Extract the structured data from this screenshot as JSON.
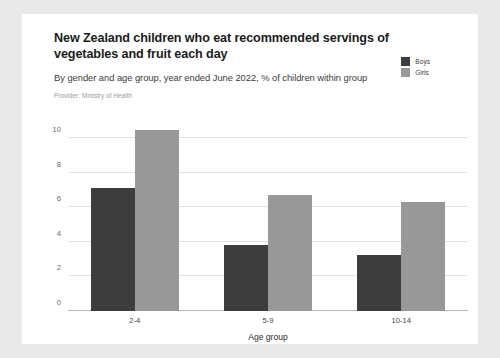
{
  "card": {
    "background": "#ffffff",
    "page_background": "#e9e9e9"
  },
  "header": {
    "title": "New Zealand children who eat recommended servings of vegetables and fruit each day",
    "subtitle": "By gender and age group, year ended June 2022, % of children within group",
    "provider": "Provider: Ministry of Health"
  },
  "colors": {
    "boys": "#3d3d3d",
    "girls": "#989898",
    "gridline": "#e2e2e2",
    "axis": "#b9b9b9",
    "title_text": "#1b1b1b",
    "subtitle_text": "#3c3c3c",
    "provider_text": "#9a9a9a",
    "tick_text": "#666666"
  },
  "legend": {
    "position": "top-right",
    "items": [
      {
        "label": "Boys",
        "color": "#3d3d3d"
      },
      {
        "label": "Girls",
        "color": "#989898"
      }
    ]
  },
  "chart_data": {
    "type": "bar",
    "title": "New Zealand children who eat recommended servings of vegetables and fruit each day",
    "subtitle": "By gender and age group, year ended June 2022, % of children within group",
    "categories": [
      "2-4",
      "5-9",
      "10-14"
    ],
    "series": [
      {
        "name": "Boys",
        "color": "#3d3d3d",
        "values": [
          7.1,
          3.8,
          3.25
        ]
      },
      {
        "name": "Girls",
        "color": "#989898",
        "values": [
          10.5,
          6.7,
          6.3
        ]
      }
    ],
    "xlabel": "Age group",
    "ylabel": "",
    "ylim": [
      0,
      11
    ],
    "yticks": [
      0,
      2,
      4,
      6,
      8,
      10
    ],
    "ytick_labels": [
      "0",
      "2",
      "4",
      "6",
      "8",
      "10"
    ],
    "grid": true,
    "legend_position": "top-right"
  }
}
